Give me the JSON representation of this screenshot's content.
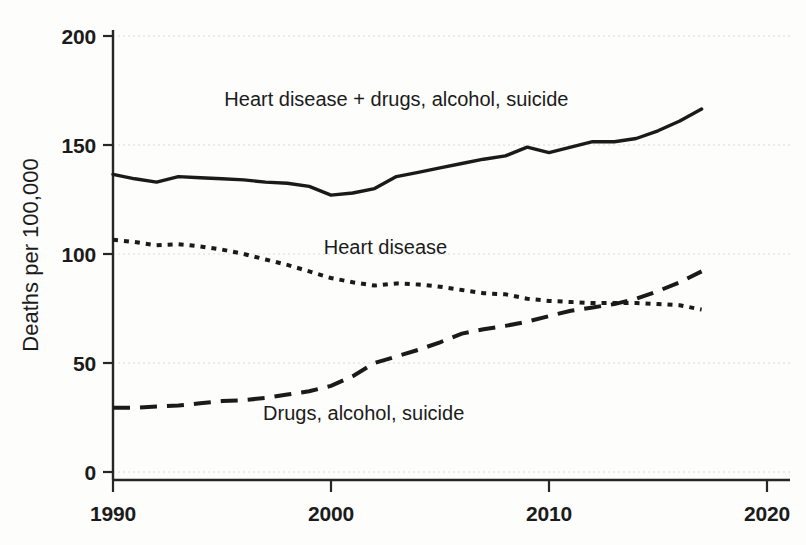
{
  "chart_data": {
    "type": "line",
    "title": "",
    "xlabel": "",
    "ylabel": "Deaths per 100,000",
    "xlim": [
      1990,
      2020
    ],
    "ylim": [
      0,
      200
    ],
    "xticks": [
      1990,
      2000,
      2010,
      2020
    ],
    "yticks": [
      0,
      50,
      100,
      150,
      200
    ],
    "grid": true,
    "legend_position": "inline-labels",
    "x": [
      1990,
      1991,
      1992,
      1993,
      1994,
      1995,
      1996,
      1997,
      1998,
      1999,
      2000,
      2001,
      2002,
      2003,
      2004,
      2005,
      2006,
      2007,
      2008,
      2009,
      2010,
      2011,
      2012,
      2013,
      2014,
      2015,
      2016,
      2017
    ],
    "series": [
      {
        "name": "Heart disease + drugs, alcohol, suicide",
        "style": "solid",
        "label_x": 2003.0,
        "label_y": 168,
        "values": [
          136.5,
          134.5,
          133.0,
          135.5,
          135.0,
          134.5,
          134.0,
          133.0,
          132.5,
          131.0,
          127.0,
          128.0,
          130.0,
          135.5,
          137.5,
          139.5,
          141.5,
          143.5,
          145.0,
          149.0,
          146.5,
          149.0,
          151.5,
          151.5,
          153.0,
          156.5,
          161.0,
          166.5
        ]
      },
      {
        "name": "Heart disease",
        "style": "dotted",
        "label_x": 2002.5,
        "label_y": 100,
        "values": [
          106.5,
          105.5,
          104.0,
          104.5,
          103.5,
          102.0,
          100.0,
          97.5,
          95.0,
          92.0,
          89.0,
          87.0,
          85.5,
          86.5,
          86.0,
          85.0,
          83.5,
          82.0,
          81.5,
          79.5,
          78.5,
          78.0,
          77.5,
          77.5,
          77.5,
          77.0,
          76.5,
          74.5
        ]
      },
      {
        "name": "Drugs, alcohol, suicide",
        "style": "dashed",
        "label_x": 2001.5,
        "label_y": 24,
        "values": [
          29.5,
          29.5,
          30.0,
          30.5,
          31.5,
          32.5,
          33.0,
          34.0,
          35.5,
          37.0,
          39.5,
          44.0,
          50.0,
          53.0,
          56.0,
          59.5,
          63.5,
          65.5,
          67.0,
          69.0,
          71.5,
          74.0,
          75.5,
          77.0,
          79.5,
          83.0,
          87.0,
          92.0
        ]
      }
    ]
  },
  "axes": {
    "y_axis_title": "Deaths per 100,000",
    "y_tick_labels": [
      "200",
      "150",
      "100",
      "50",
      "0"
    ],
    "x_tick_labels": [
      "1990",
      "2000",
      "2010",
      "2020"
    ]
  }
}
